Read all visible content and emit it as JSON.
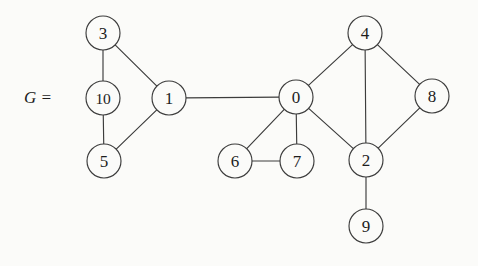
{
  "figure": {
    "label": "G =",
    "label_x": 38,
    "label_y": 97,
    "background_color": "#fbfbf9",
    "stroke_color": "#3c3c3c",
    "text_color": "#1d1d1d",
    "width": 478,
    "height": 266
  },
  "graph": {
    "node_radius": 17,
    "nodes": [
      {
        "id": "3",
        "label": "3",
        "x": 103,
        "y": 33
      },
      {
        "id": "10",
        "label": "10",
        "x": 103,
        "y": 98
      },
      {
        "id": "1",
        "label": "1",
        "x": 169,
        "y": 98
      },
      {
        "id": "5",
        "label": "5",
        "x": 104,
        "y": 161
      },
      {
        "id": "0",
        "label": "0",
        "x": 296,
        "y": 97
      },
      {
        "id": "4",
        "label": "4",
        "x": 365,
        "y": 33
      },
      {
        "id": "8",
        "label": "8",
        "x": 432,
        "y": 96
      },
      {
        "id": "6",
        "label": "6",
        "x": 235,
        "y": 161
      },
      {
        "id": "7",
        "label": "7",
        "x": 297,
        "y": 161
      },
      {
        "id": "2",
        "label": "2",
        "x": 366,
        "y": 160
      },
      {
        "id": "9",
        "label": "9",
        "x": 366,
        "y": 226
      }
    ],
    "edges": [
      {
        "from": "3",
        "to": "10"
      },
      {
        "from": "3",
        "to": "1"
      },
      {
        "from": "10",
        "to": "5"
      },
      {
        "from": "5",
        "to": "1"
      },
      {
        "from": "1",
        "to": "0"
      },
      {
        "from": "0",
        "to": "4"
      },
      {
        "from": "0",
        "to": "6"
      },
      {
        "from": "0",
        "to": "7"
      },
      {
        "from": "0",
        "to": "2"
      },
      {
        "from": "6",
        "to": "7"
      },
      {
        "from": "4",
        "to": "8"
      },
      {
        "from": "4",
        "to": "2"
      },
      {
        "from": "8",
        "to": "2"
      },
      {
        "from": "2",
        "to": "9"
      }
    ]
  }
}
